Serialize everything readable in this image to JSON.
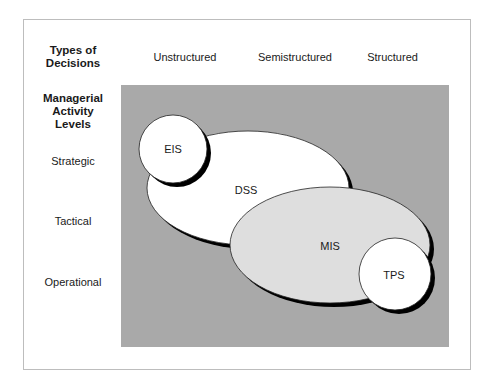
{
  "header": {
    "row_title": "Types of Decisions",
    "row_title_lines": [
      "Types of",
      "Decisions"
    ],
    "columns": [
      "Unstructured",
      "Semistructured",
      "Structured"
    ]
  },
  "sidebar": {
    "title_lines": [
      "Managerial",
      "Activity",
      "Levels"
    ],
    "levels": [
      "Strategic",
      "Tactical",
      "Operational"
    ]
  },
  "systems": [
    {
      "id": "EIS",
      "label": "EIS",
      "shape": "circle",
      "fill": "#ffffff"
    },
    {
      "id": "DSS",
      "label": "DSS",
      "shape": "ellipse",
      "fill": "#ffffff"
    },
    {
      "id": "MIS",
      "label": "MIS",
      "shape": "ellipse",
      "fill": "#dedede"
    },
    {
      "id": "TPS",
      "label": "TPS",
      "shape": "circle",
      "fill": "#ffffff"
    }
  ],
  "colors": {
    "background_panel": "#a9a9a9",
    "shadow": "#000000",
    "frame_border": "#bdbdbd"
  }
}
